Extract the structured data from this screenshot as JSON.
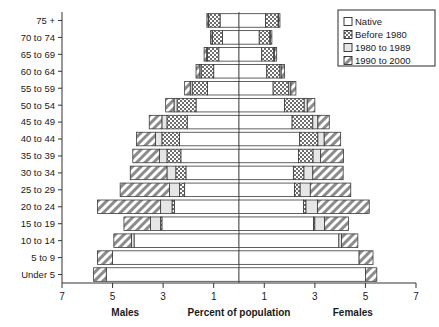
{
  "chart_data": {
    "type": "bar",
    "subtype": "population-pyramid",
    "title": "",
    "xlabel": "Percent of population",
    "ylabel": "",
    "left_label": "Males",
    "right_label": "Females",
    "xlim": [
      -7,
      7
    ],
    "xticks": [
      7,
      5,
      3,
      1,
      1,
      3,
      5,
      7
    ],
    "xtick_values": [
      -7,
      -5,
      -3,
      -1,
      1,
      3,
      5,
      7
    ],
    "grid": false,
    "legend_position": "top-right",
    "stacked": true,
    "categories": [
      "Under 5",
      "5 to 9",
      "10 to 14",
      "15 to 19",
      "20 to 24",
      "25 to 29",
      "30 to 34",
      "35 to 39",
      "40 to 44",
      "45 to 49",
      "50 to 54",
      "55 to 59",
      "60 to 64",
      "65 to 69",
      "70 to 74",
      "75 +"
    ],
    "legend": [
      {
        "label": "Native",
        "pattern": "solid-white",
        "color": "#ffffff"
      },
      {
        "label": "Before 1980",
        "pattern": "crosshatch",
        "color": "#9a9a9a"
      },
      {
        "label": "1980 to 1989",
        "pattern": "light-gray",
        "color": "#e3e3e3"
      },
      {
        "label": "1990 to 2000",
        "pattern": "diagonal-hatch",
        "color": "#b8b8b8"
      }
    ],
    "series": [
      {
        "name": "Native",
        "males": [
          5.25,
          5.0,
          4.15,
          3.05,
          2.55,
          2.15,
          2.1,
          2.3,
          2.35,
          2.05,
          1.7,
          1.25,
          1.0,
          0.8,
          0.65,
          0.75
        ],
        "females": [
          5.0,
          4.75,
          3.95,
          2.95,
          2.55,
          2.2,
          2.15,
          2.35,
          2.4,
          2.1,
          1.8,
          1.35,
          1.1,
          0.9,
          0.8,
          1.05
        ]
      },
      {
        "name": "Before 1980",
        "males": [
          0.0,
          0.0,
          0.0,
          0.05,
          0.1,
          0.2,
          0.4,
          0.55,
          0.7,
          0.8,
          0.75,
          0.6,
          0.5,
          0.45,
          0.4,
          0.45
        ],
        "females": [
          0.0,
          0.0,
          0.0,
          0.05,
          0.1,
          0.22,
          0.42,
          0.58,
          0.72,
          0.82,
          0.78,
          0.62,
          0.52,
          0.47,
          0.42,
          0.5
        ]
      },
      {
        "name": "1980 to 1989",
        "males": [
          0.0,
          0.0,
          0.1,
          0.4,
          0.45,
          0.4,
          0.35,
          0.3,
          0.25,
          0.2,
          0.12,
          0.08,
          0.05,
          0.03,
          0.02,
          0.02
        ],
        "females": [
          0.0,
          0.0,
          0.1,
          0.38,
          0.45,
          0.4,
          0.35,
          0.3,
          0.25,
          0.2,
          0.12,
          0.08,
          0.05,
          0.03,
          0.02,
          0.02
        ]
      },
      {
        "name": "1990 to 2000",
        "males": [
          0.5,
          0.6,
          0.7,
          1.05,
          2.5,
          1.95,
          1.45,
          1.05,
          0.75,
          0.5,
          0.33,
          0.22,
          0.15,
          0.1,
          0.06,
          0.05
        ],
        "females": [
          0.45,
          0.55,
          0.65,
          0.95,
          2.05,
          1.6,
          1.2,
          0.9,
          0.65,
          0.45,
          0.3,
          0.2,
          0.13,
          0.09,
          0.06,
          0.05
        ]
      }
    ]
  }
}
